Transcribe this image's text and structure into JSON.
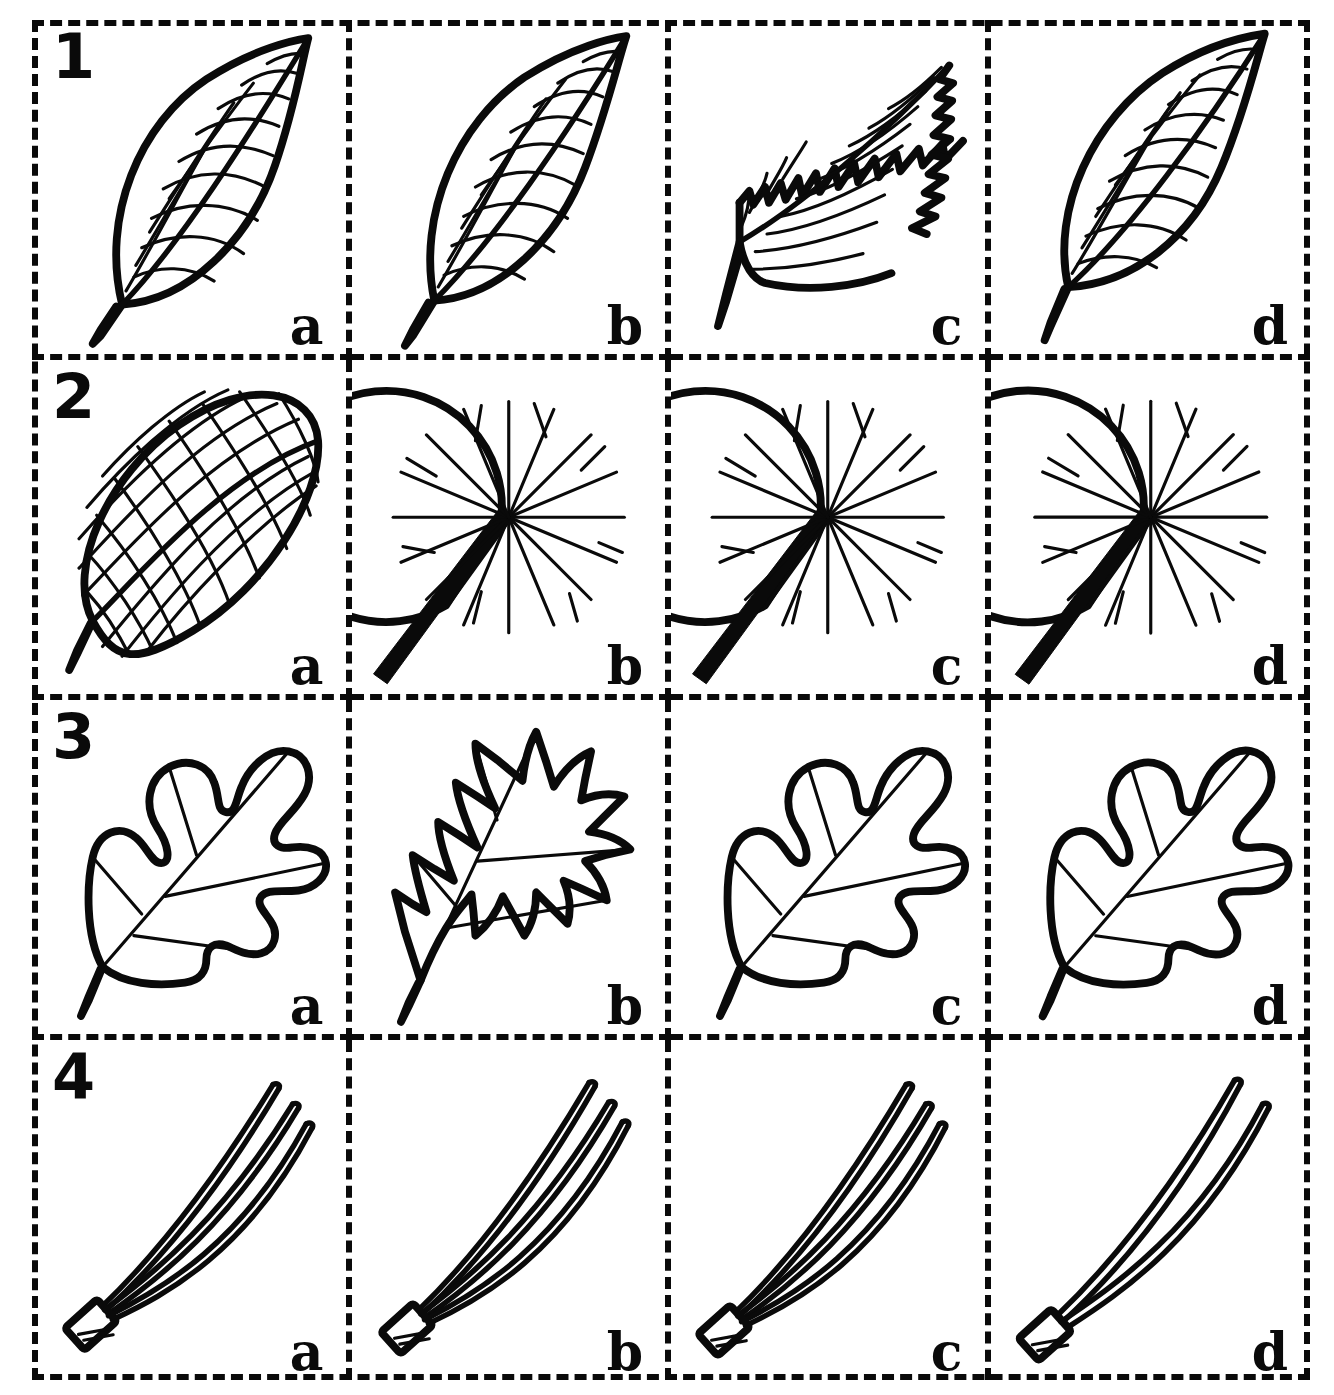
{
  "figure": {
    "kind": "leaf-identification-comparison-grid",
    "rows": 4,
    "columns": 4,
    "column_labels": [
      "a",
      "b",
      "c",
      "d"
    ],
    "row_numbers": [
      "1",
      "2",
      "3",
      "4"
    ],
    "ink_color": "#0a0a0a",
    "background_color": "#ffffff",
    "border_style": "dashed"
  },
  "rows": [
    {
      "number": "1",
      "group_name": "simple-pinnate-leaves",
      "cells": [
        {
          "label": "a",
          "art": "leaf-simple-entire",
          "description": "simple elliptic leaf, entire margin, pinnate venation, short petiole"
        },
        {
          "label": "b",
          "art": "leaf-simple-narrow",
          "description": "narrow acuminate leaf, entire margin, pinnate venation"
        },
        {
          "label": "c",
          "art": "leaf-serrated",
          "description": "lanceolate leaf with serrated toothed margin, pinnate venation"
        },
        {
          "label": "d",
          "art": "leaf-simple-ovate",
          "description": "ovate leaf, entire margin, pinnate venation"
        }
      ]
    },
    {
      "number": "2",
      "group_name": "round-and-parallel-veined-leaves",
      "cells": [
        {
          "label": "a",
          "art": "leaf-lattice-venation",
          "description": "elliptic leaf with arcuate parallel veins crossed by secondary veins forming a lattice"
        },
        {
          "label": "b",
          "art": "leaf-peltate-round",
          "description": "round peltate leaf, radiating palmate veins, basal sinus, long stout petiole"
        },
        {
          "label": "c",
          "art": "leaf-peltate-round",
          "description": "round peltate leaf, radiating palmate veins, basal sinus, long stout petiole"
        },
        {
          "label": "d",
          "art": "leaf-peltate-round",
          "description": "round peltate leaf, radiating palmate veins, basal sinus, long stout petiole"
        }
      ]
    },
    {
      "number": "3",
      "group_name": "lobed-oak-leaves",
      "cells": [
        {
          "label": "a",
          "art": "leaf-oak-rounded-lobes",
          "description": "oak leaf with rounded lobes and shallow sinuses"
        },
        {
          "label": "b",
          "art": "leaf-oak-pointed-lobes",
          "description": "oak leaf with sharply pointed bristle-tipped lobes and deep sinuses"
        },
        {
          "label": "c",
          "art": "leaf-oak-rounded-lobes",
          "description": "oak leaf with rounded lobes and shallow sinuses"
        },
        {
          "label": "d",
          "art": "leaf-oak-rounded-lobes",
          "description": "oak leaf with rounded lobes and shallow sinuses"
        }
      ]
    },
    {
      "number": "4",
      "group_name": "pine-needle-fascicles",
      "cells": [
        {
          "label": "a",
          "art": "needle-fascicle-3",
          "needle_count": 3,
          "description": "fascicle of three pine needles bound by a basal sheath"
        },
        {
          "label": "b",
          "art": "needle-fascicle-3",
          "needle_count": 3,
          "description": "fascicle of three pine needles bound by a basal sheath"
        },
        {
          "label": "c",
          "art": "needle-fascicle-3",
          "needle_count": 3,
          "description": "fascicle of three pine needles bound by a basal sheath"
        },
        {
          "label": "d",
          "art": "needle-fascicle-2",
          "needle_count": 2,
          "description": "fascicle of two pine needles bound by a basal sheath"
        }
      ]
    }
  ]
}
